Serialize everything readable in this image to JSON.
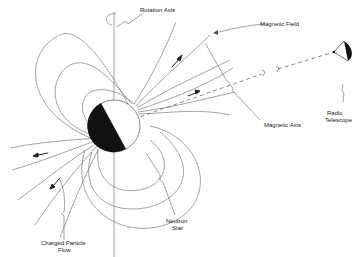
{
  "diagram": {
    "labels": {
      "rotation_axis": "Rotation Axis",
      "magnetic_field": "Magnetic Field",
      "radio_telescope_line1": "Radio",
      "radio_telescope_line2": "Telescope",
      "magnetic_axis": "Magnetic Axis",
      "neutron_star_line1": "Neutron",
      "neutron_star_line2": "Star",
      "charged_particle_flow_line1": "Charged Particle",
      "charged_particle_flow_line2": "Flow"
    },
    "colors": {
      "line": "#555555",
      "star_dark": "#111111",
      "background": "#ffffff"
    }
  }
}
